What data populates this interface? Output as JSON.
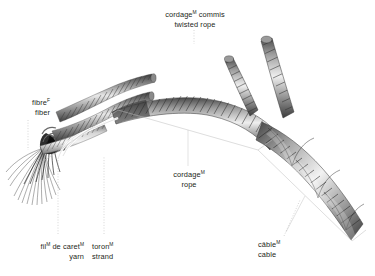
{
  "figure": {
    "title_fr": "cordage",
    "title_gender": "M",
    "title_fr_suffix": " commis",
    "title_en": "twisted rope",
    "background": "#ffffff",
    "text_color": "#231f20",
    "leader_color": "#b9b9b9"
  },
  "labels": {
    "title": {
      "fr_term": "cordage",
      "fr_gender": "M",
      "fr_rest": " commis",
      "en_term": "twisted rope"
    },
    "fibre": {
      "fr_term": "fibre",
      "fr_gender": "F",
      "fr_rest": "",
      "en_term": "fiber"
    },
    "yarn": {
      "fr_term": "fil",
      "fr_gender": "M",
      "fr_rest": " de caret",
      "fr_gender2": "M",
      "en_term": "yarn"
    },
    "strand": {
      "fr_term": "toron",
      "fr_gender": "M",
      "fr_rest": "",
      "en_term": "strand"
    },
    "rope": {
      "fr_term": "cordage",
      "fr_gender": "M",
      "fr_rest": "",
      "en_term": "rope"
    },
    "cable": {
      "fr_term": "câble",
      "fr_gender": "M",
      "fr_rest": "",
      "en_term": "cable"
    }
  }
}
